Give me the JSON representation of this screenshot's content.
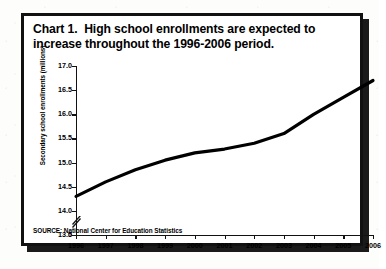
{
  "figure": {
    "title_line_1": "Chart 1.  High school enrollments are expected to",
    "title_line_2": "increase throughout the 1996-2006 period.",
    "source_note": "SOURCE: National Center for Education Statistics",
    "border_color": "#111111",
    "line_color": "#000000",
    "background_color": "#ffffff"
  },
  "chart_data": {
    "type": "line",
    "title": "Chart 1.  High school enrollments are expected to increase throughout the 1996-2006 period.",
    "xlabel": "",
    "ylabel": "Secondary school enrollments (millions)",
    "x": [
      1996,
      1997,
      1998,
      1999,
      2000,
      2001,
      2002,
      2003,
      2004,
      2005,
      2006
    ],
    "categories": [
      "1996",
      "1997",
      "1998",
      "1999",
      "2000",
      "2001",
      "2002",
      "2003",
      "2004",
      "2005",
      "2006"
    ],
    "values": [
      14.3,
      14.6,
      14.85,
      15.05,
      15.2,
      15.28,
      15.4,
      15.6,
      16.0,
      16.35,
      16.7
    ],
    "series": [
      {
        "name": "Secondary school enrollments (millions)",
        "values": [
          14.3,
          14.6,
          14.85,
          15.05,
          15.2,
          15.28,
          15.4,
          15.6,
          16.0,
          16.35,
          16.7
        ]
      }
    ],
    "ylim": [
      13.5,
      17.0
    ],
    "xlim": [
      1996,
      2006
    ],
    "y_ticks": [
      13.5,
      14.0,
      14.5,
      15.0,
      15.5,
      16.0,
      16.5,
      17.0
    ],
    "y_tick_labels": [
      "13.5",
      "14.0",
      "14.5",
      "15.0",
      "15.5",
      "16.0",
      "16.5",
      "17.0"
    ],
    "y_origin_label": "0",
    "y_axis_break": true,
    "x_ticks": [
      1996,
      1997,
      1998,
      1999,
      2000,
      2001,
      2002,
      2003,
      2004,
      2005,
      2006
    ],
    "x_tick_labels": [
      "1996",
      "1997",
      "1998",
      "1999",
      "2000",
      "2001",
      "2002",
      "2003",
      "2004",
      "2005",
      "2006"
    ],
    "grid": false,
    "legend": false,
    "legend_position": "none",
    "line_color": "#000000",
    "line_width": 3
  }
}
